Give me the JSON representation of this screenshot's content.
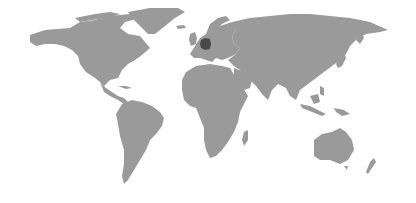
{
  "map": {
    "type": "world choropleth",
    "colors": {
      "background": "#ffffff",
      "land": "#9a9a9a",
      "highlight": "#4a4a4a"
    },
    "highlighted_regions": [
      {
        "name": "Germany",
        "color": "#4a4a4a"
      }
    ]
  }
}
